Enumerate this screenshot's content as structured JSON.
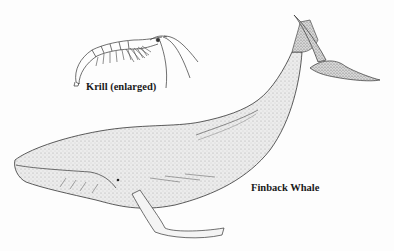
{
  "illustration": {
    "krill": {
      "label": "Krill (enlarged)"
    },
    "whale": {
      "label": "Finback Whale"
    }
  },
  "colors": {
    "ink": "#1a1a1a",
    "stipple_fill": "#e4e4e4",
    "background": "#fdfdfd"
  }
}
